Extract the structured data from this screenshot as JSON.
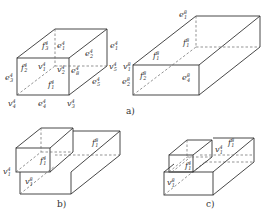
{
  "figure": {
    "panels": [
      {
        "id": "a",
        "caption": "a)",
        "left_box_labels": {
          "f_top": "f",
          "f_top_sup": "4",
          "f_top_sub": "3",
          "e_top_back": "e",
          "e_top_back_sup": "4",
          "e_top_back_sub": "1",
          "f_front": "f",
          "f_front_sup": "4",
          "f_front_sub": "2",
          "v_front": "v",
          "v_front_sup": "4",
          "v_front_sub": "1",
          "v_mid": "v",
          "v_mid_sup": "4",
          "v_mid_sub": "2",
          "e_right_front": "e",
          "e_right_front_sup": "4",
          "e_right_front_sub": "8",
          "e_right_top": "e",
          "e_right_top_sup": "4",
          "e_right_top_sub": "2",
          "f_bottom": "f",
          "f_bottom_sup": "4",
          "f_bottom_sub": "1",
          "e_left": "e",
          "e_left_sup": "4",
          "e_left_sub": "3",
          "v_bl": "v",
          "v_bl_sup": "4",
          "v_bl_sub": "4",
          "e_bottom": "e",
          "e_bottom_sup": "4",
          "e_bottom_sub": "4",
          "v_br": "v",
          "v_br_sup": "4",
          "v_br_sub": "3",
          "e_right_bottom": "e",
          "e_right_bottom_sup": "4",
          "e_right_bottom_sub": "5",
          "v_right": "v",
          "v_right_sup": "4",
          "v_right_sub": "5",
          "e_far_right": "e",
          "e_far_right_sup": "4",
          "e_far_right_sub": "1"
        },
        "right_box_labels": {
          "e_top": "e",
          "e_top_sup": "8",
          "e_top_sub": "1",
          "f_back": "f",
          "f_back_sup": "8",
          "f_back_sub": "1",
          "f_top": "f",
          "f_top_sup": "8",
          "f_top_sub": "1",
          "v_left": "v",
          "v_left_sup": "8",
          "v_left_sub": "1",
          "f_front": "f",
          "f_front_sup": "8",
          "f_front_sub": "2",
          "e_left": "e",
          "e_left_sup": "8",
          "e_left_sub": "2",
          "e_front": "e",
          "e_front_sup": "8",
          "e_front_sub": "4"
        }
      },
      {
        "id": "b",
        "caption": "b)",
        "labels": {
          "f_top": "f",
          "f_top_sup": "8",
          "f_top_sub": "1",
          "f_small": "f",
          "f_small_sup": "4",
          "f_small_sub": "1",
          "v_left": "v",
          "v_left_sup": "4",
          "v_left_sub": "1",
          "v_low": "v",
          "v_low_sup": "8",
          "v_low_sub": "1"
        }
      },
      {
        "id": "c",
        "caption": "c)",
        "labels": {
          "f_top": "f",
          "f_top_sup": "8",
          "f_top_sub": "1",
          "v_top": "v",
          "v_top_sup": "4",
          "v_top_sub": "1",
          "f_small": "f",
          "f_small_sup": "4",
          "f_small_sub": "1",
          "v_low": "v",
          "v_low_sup": "8",
          "v_low_sub": "1"
        }
      }
    ]
  }
}
